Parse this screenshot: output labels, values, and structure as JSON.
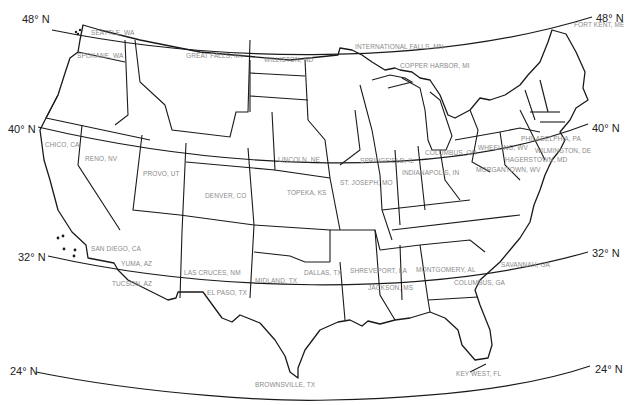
{
  "map": {
    "title": "Contiguous United States with latitude lines",
    "latitudes": [
      {
        "label": "48° N",
        "left": {
          "x": 22,
          "y": 13
        },
        "right": {
          "x": 596,
          "y": 12
        }
      },
      {
        "label": "40° N",
        "left": {
          "x": 8,
          "y": 123
        },
        "right": {
          "x": 592,
          "y": 122
        }
      },
      {
        "label": "32° N",
        "left": {
          "x": 18,
          "y": 251
        },
        "right": {
          "x": 592,
          "y": 247
        }
      },
      {
        "label": "24° N",
        "left": {
          "x": 10,
          "y": 365
        },
        "right": {
          "x": 595,
          "y": 363
        }
      }
    ],
    "cities": [
      {
        "name": "SEATTLE, WA",
        "x": 91,
        "y": 33
      },
      {
        "name": "SPOKANE, WA",
        "x": 77,
        "y": 56
      },
      {
        "name": "GREAT FALLS, MT",
        "x": 186,
        "y": 56
      },
      {
        "name": "WILLISTON, ND",
        "x": 264,
        "y": 60
      },
      {
        "name": "INTERNATIONAL FALLS, MN",
        "x": 355,
        "y": 47
      },
      {
        "name": "COPPER HARBOR, MI",
        "x": 400,
        "y": 66
      },
      {
        "name": "FORT KENT, ME",
        "x": 574,
        "y": 25
      },
      {
        "name": "CHICO, CA",
        "x": 45,
        "y": 145
      },
      {
        "name": "RENO, NV",
        "x": 85,
        "y": 159
      },
      {
        "name": "PROVO, UT",
        "x": 143,
        "y": 174
      },
      {
        "name": "DENVER, CO",
        "x": 205,
        "y": 196
      },
      {
        "name": "LINCOLN, NE",
        "x": 278,
        "y": 160
      },
      {
        "name": "TOPEKA, KS",
        "x": 287,
        "y": 193
      },
      {
        "name": "ST. JOSEPH, MO",
        "x": 340,
        "y": 183
      },
      {
        "name": "SPRINGFIELD, IL",
        "x": 360,
        "y": 161
      },
      {
        "name": "INDIANAPOLIS, IN",
        "x": 402,
        "y": 173
      },
      {
        "name": "COLUMBUS, OH",
        "x": 425,
        "y": 153
      },
      {
        "name": "WHEELING, WV",
        "x": 478,
        "y": 148
      },
      {
        "name": "MORGANTOWN, WV",
        "x": 476,
        "y": 170
      },
      {
        "name": "PHILADELPHIA, PA",
        "x": 521,
        "y": 139
      },
      {
        "name": "WILMINGTON, DE",
        "x": 535,
        "y": 151
      },
      {
        "name": "HAGERSTOWN, MD",
        "x": 505,
        "y": 160
      },
      {
        "name": "SAN DIEGO, CA",
        "x": 91,
        "y": 249
      },
      {
        "name": "YUMA, AZ",
        "x": 121,
        "y": 264
      },
      {
        "name": "TUCSON, AZ",
        "x": 112,
        "y": 284
      },
      {
        "name": "LAS CRUCES, NM",
        "x": 184,
        "y": 273
      },
      {
        "name": "EL PASO, TX",
        "x": 207,
        "y": 293
      },
      {
        "name": "MIDLAND, TX",
        "x": 255,
        "y": 281
      },
      {
        "name": "DALLAS, TX",
        "x": 304,
        "y": 273
      },
      {
        "name": "SHREVEPORT, LA",
        "x": 350,
        "y": 271
      },
      {
        "name": "JACKSON, MS",
        "x": 368,
        "y": 288
      },
      {
        "name": "MONTGOMERY, AL",
        "x": 416,
        "y": 270
      },
      {
        "name": "COLUMBUS, GA",
        "x": 454,
        "y": 283
      },
      {
        "name": "SAVANNAH, GA",
        "x": 501,
        "y": 265
      },
      {
        "name": "BROWNSVILLE, TX",
        "x": 255,
        "y": 385
      },
      {
        "name": "KEY WEST, FL",
        "x": 456,
        "y": 374
      }
    ],
    "colors": {
      "outline": "#1a1a1a",
      "city_label": "#8a8a8a",
      "latitude_label": "#222222",
      "background": "#ffffff"
    }
  }
}
